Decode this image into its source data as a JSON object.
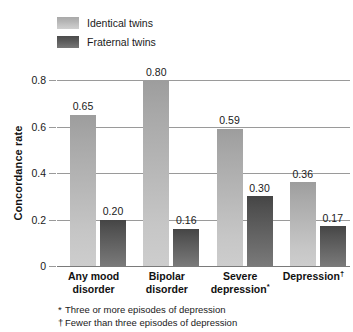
{
  "chart_data": {
    "type": "bar",
    "title": "",
    "xlabel": "",
    "ylabel": "Concordance rate",
    "ylim": [
      0,
      0.8
    ],
    "yticks": [
      "0",
      "0.2",
      "0.4",
      "0.6",
      "0.8"
    ],
    "ytick_values": [
      0,
      0.2,
      0.4,
      0.6,
      0.8
    ],
    "grid": true,
    "legend_position": "top-left",
    "categories": [
      "Any mood disorder",
      "Bipolar disorder",
      "Severe depression*",
      "Depression†"
    ],
    "series": [
      {
        "name": "Identical twins",
        "color": "#b4b4b4",
        "values": [
          0.65,
          0.8,
          0.59,
          0.36
        ],
        "labels": [
          "0.65",
          "0.80",
          "0.59",
          "0.36"
        ]
      },
      {
        "name": "Fraternal twins",
        "color": "#5a5a5a",
        "values": [
          0.2,
          0.16,
          0.3,
          0.17
        ],
        "labels": [
          "0.20",
          "0.16",
          "0.30",
          "0.17"
        ]
      }
    ],
    "annotations": [
      "* Three or more episodes of depression",
      "† Fewer than three episodes of depression"
    ]
  },
  "legend": {
    "items": [
      {
        "label": "Identical twins",
        "swatch": "identical-twins-swatch"
      },
      {
        "label": "Fraternal twins",
        "swatch": "fraternal-twins-swatch"
      }
    ]
  },
  "axis": {
    "y_title": "Concordance rate",
    "y_ticks": [
      {
        "label": "0.8",
        "value": 0.8
      },
      {
        "label": "0.6",
        "value": 0.6
      },
      {
        "label": "0.4",
        "value": 0.4
      },
      {
        "label": "0.2",
        "value": 0.2
      },
      {
        "label": "0",
        "value": 0
      }
    ]
  },
  "categories": [
    {
      "line1": "Any mood",
      "line2": "disorder",
      "mark": ""
    },
    {
      "line1": "Bipolar",
      "line2": "disorder",
      "mark": ""
    },
    {
      "line1": "Severe",
      "line2": "depression",
      "mark": "*"
    },
    {
      "line1": "Depression",
      "line2": "",
      "mark": "†"
    }
  ],
  "footnotes": [
    {
      "mark": "*",
      "text": "Three or more episodes of depression"
    },
    {
      "mark": "†",
      "text": "Fewer than three episodes of depression"
    }
  ]
}
